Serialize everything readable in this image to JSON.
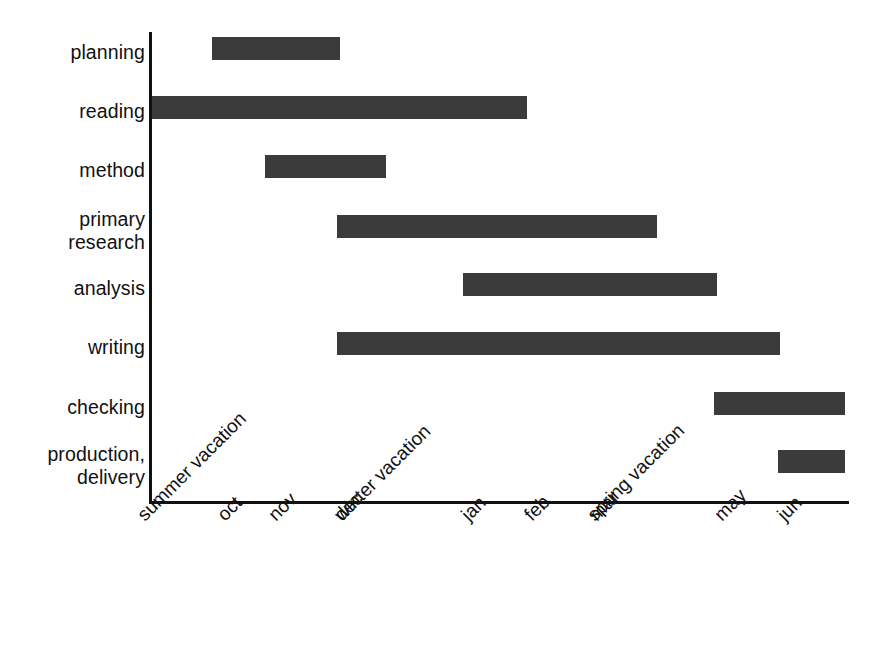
{
  "chart_data": {
    "type": "bar",
    "orientation": "horizontal",
    "subtype": "gantt",
    "title": "",
    "xlabel": "",
    "ylabel": "",
    "grid": false,
    "legend": null,
    "categories": [
      "planning",
      "reading",
      "method",
      "primary\nresearch",
      "analysis",
      "writing",
      "checking",
      "production,\ndelivery"
    ],
    "x_tick_labels": [
      "summer vacation",
      "oct",
      "nov",
      "dec",
      "winter vacation",
      "jan",
      "feb",
      "mar",
      "spring vacation",
      "may",
      "jun"
    ],
    "xlim": [
      0,
      11
    ],
    "bar_color": "#3b3b3b",
    "axis_color": "#111111",
    "background_color": "#ffffff",
    "tasks": [
      {
        "name": "planning",
        "start_label": "oct",
        "end_label": "dec",
        "start": 1.0,
        "end": 3.0,
        "bar_left_px": 212,
        "bar_width_px": 128,
        "bar_top_px": 37
      },
      {
        "name": "reading",
        "start_label": "summer vacation",
        "end_label": "winter vacation",
        "start": 0.0,
        "end": 6.0,
        "bar_left_px": 152,
        "bar_width_px": 375,
        "bar_top_px": 96
      },
      {
        "name": "method",
        "start_label": "nov",
        "end_label": "dec",
        "start": 1.85,
        "end": 3.75,
        "bar_left_px": 265,
        "bar_width_px": 121,
        "bar_top_px": 155
      },
      {
        "name": "primary research",
        "start_label": "dec",
        "end_label": "mar",
        "start": 2.75,
        "end": 8.0,
        "bar_left_px": 337,
        "bar_width_px": 320,
        "bar_top_px": 215
      },
      {
        "name": "analysis",
        "start_label": "winter vacation",
        "end_label": "spring vacation",
        "start": 4.95,
        "end": 8.95,
        "bar_left_px": 463,
        "bar_width_px": 254,
        "bar_top_px": 273
      },
      {
        "name": "writing",
        "start_label": "dec",
        "end_label": "may",
        "start": 2.95,
        "end": 9.9,
        "bar_left_px": 337,
        "bar_width_px": 443,
        "bar_top_px": 332
      },
      {
        "name": "checking",
        "start_label": "spring vacation",
        "end_label": "jun",
        "start": 8.85,
        "end": 11.0,
        "bar_left_px": 714,
        "bar_width_px": 131,
        "bar_top_px": 392
      },
      {
        "name": "production, delivery",
        "start_label": "may",
        "end_label": "jun",
        "start": 9.85,
        "end": 11.0,
        "bar_left_px": 778,
        "bar_width_px": 67,
        "bar_top_px": 450
      }
    ]
  },
  "rows": [
    {
      "label": "planning",
      "label_top": 41,
      "lines": 1
    },
    {
      "label": "reading",
      "label_top": 100,
      "lines": 1
    },
    {
      "label": "method",
      "label_top": 159,
      "lines": 1
    },
    {
      "label": "primary\nresearch",
      "label_top": 208,
      "lines": 2
    },
    {
      "label": "analysis",
      "label_top": 277,
      "lines": 1
    },
    {
      "label": "writing",
      "label_top": 336,
      "lines": 1
    },
    {
      "label": "checking",
      "label_top": 396,
      "lines": 1
    },
    {
      "label": "production,\ndelivery",
      "label_top": 443,
      "lines": 2
    }
  ],
  "xticks": [
    {
      "label": "summer vacation",
      "x": 133
    },
    {
      "label": "oct",
      "x": 213
    },
    {
      "label": "nov",
      "x": 264
    },
    {
      "label": "dec",
      "x": 330
    },
    {
      "label": "winter vacation",
      "x": 330
    },
    {
      "label": "jan",
      "x": 457
    },
    {
      "label": "feb",
      "x": 520
    },
    {
      "label": "mar",
      "x": 585
    },
    {
      "label": "spring vacation",
      "x": 583
    },
    {
      "label": "may",
      "x": 710
    },
    {
      "label": "jun",
      "x": 773
    }
  ]
}
